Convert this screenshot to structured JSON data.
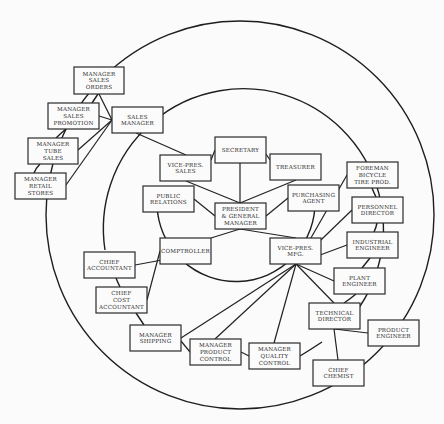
{
  "diagram": {
    "type": "organization-chart-circular",
    "rings": [
      {
        "name": "outer-ring",
        "cx": 240,
        "cy": 215,
        "r": 194
      },
      {
        "name": "middle-ring-arc",
        "path": "M 105 250 A 140 140 0 1 1 345 325"
      },
      {
        "name": "inner-ring-arc",
        "path": "M 157 205 A 70 70 0 1 0 315 200"
      }
    ],
    "nodes": [
      {
        "id": "mgr_sales_orders",
        "lines": [
          "MANAGER",
          "SALES",
          "ORDERS"
        ],
        "x": 74,
        "y": 67,
        "w": 50,
        "h": 27
      },
      {
        "id": "mgr_sales_promotion",
        "lines": [
          "MANAGER",
          "SALES",
          "PROMOTION"
        ],
        "x": 48,
        "y": 103,
        "w": 51,
        "h": 26
      },
      {
        "id": "sales_manager",
        "lines": [
          "SALES",
          "MANAGER"
        ],
        "x": 112,
        "y": 107,
        "w": 51,
        "h": 26
      },
      {
        "id": "mgr_tube_sales",
        "lines": [
          "MANAGER",
          "TUBE",
          "SALES"
        ],
        "x": 28,
        "y": 138,
        "w": 50,
        "h": 26
      },
      {
        "id": "mgr_retail_stores",
        "lines": [
          "MANAGER",
          "RETAIL",
          "STORES"
        ],
        "x": 15,
        "y": 173,
        "w": 51,
        "h": 26
      },
      {
        "id": "vp_sales",
        "lines": [
          "VICE-PRES.",
          "SALES"
        ],
        "x": 160,
        "y": 155,
        "w": 51,
        "h": 26
      },
      {
        "id": "secretary",
        "lines": [
          "SECRETARY"
        ],
        "x": 215,
        "y": 137,
        "w": 51,
        "h": 26
      },
      {
        "id": "treasurer",
        "lines": [
          "TREASURER"
        ],
        "x": 270,
        "y": 154,
        "w": 51,
        "h": 26
      },
      {
        "id": "public_relations",
        "lines": [
          "PUBLIC",
          "RELATIONS"
        ],
        "x": 143,
        "y": 186,
        "w": 51,
        "h": 26
      },
      {
        "id": "president",
        "lines": [
          "PRESIDENT",
          "& GENERAL",
          "MANAGER"
        ],
        "x": 215,
        "y": 203,
        "w": 51,
        "h": 26
      },
      {
        "id": "purchasing_agent",
        "lines": [
          "PURCHASING",
          "AGENT"
        ],
        "x": 288,
        "y": 185,
        "w": 51,
        "h": 26
      },
      {
        "id": "foreman_bicycle",
        "lines": [
          "FOREMAN",
          "BICYCLE",
          "TIRE PROD."
        ],
        "x": 347,
        "y": 162,
        "w": 51,
        "h": 26
      },
      {
        "id": "personnel_director",
        "lines": [
          "PERSONNEL",
          "DIRECTOR"
        ],
        "x": 352,
        "y": 197,
        "w": 51,
        "h": 26
      },
      {
        "id": "industrial_engineer",
        "lines": [
          "INDUSTRIAL",
          "ENGINEER"
        ],
        "x": 347,
        "y": 232,
        "w": 51,
        "h": 26
      },
      {
        "id": "comptroller",
        "lines": [
          "COMPTROLLER"
        ],
        "x": 160,
        "y": 238,
        "w": 51,
        "h": 26
      },
      {
        "id": "vp_mfg",
        "lines": [
          "VICE-PRES.",
          "MFG."
        ],
        "x": 270,
        "y": 238,
        "w": 51,
        "h": 26
      },
      {
        "id": "chief_accountant",
        "lines": [
          "CHIEF",
          "ACCOUNTANT"
        ],
        "x": 84,
        "y": 252,
        "w": 51,
        "h": 26
      },
      {
        "id": "plant_engineer",
        "lines": [
          "PLANT",
          "ENGINEER"
        ],
        "x": 334,
        "y": 268,
        "w": 51,
        "h": 26
      },
      {
        "id": "chief_cost_accountant",
        "lines": [
          "CHIEF",
          "COST",
          "ACCOUNTANT"
        ],
        "x": 96,
        "y": 287,
        "w": 51,
        "h": 26
      },
      {
        "id": "technical_director",
        "lines": [
          "TECHNICAL",
          "DIRECTOR"
        ],
        "x": 309,
        "y": 303,
        "w": 51,
        "h": 26
      },
      {
        "id": "product_engineer",
        "lines": [
          "PRODUCT",
          "ENGINEER"
        ],
        "x": 368,
        "y": 320,
        "w": 51,
        "h": 26
      },
      {
        "id": "mgr_shipping",
        "lines": [
          "MANAGER",
          "SHIPPING"
        ],
        "x": 130,
        "y": 325,
        "w": 51,
        "h": 26
      },
      {
        "id": "mgr_product_control",
        "lines": [
          "MANAGER",
          "PRODUCT",
          "CONTROL"
        ],
        "x": 190,
        "y": 339,
        "w": 51,
        "h": 26
      },
      {
        "id": "mgr_quality_control",
        "lines": [
          "MANAGER",
          "QUALITY",
          "CONTROL"
        ],
        "x": 249,
        "y": 343,
        "w": 51,
        "h": 26
      },
      {
        "id": "chief_chemist",
        "lines": [
          "CHIEF",
          "CHEMIST"
        ],
        "x": 313,
        "y": 360,
        "w": 51,
        "h": 26
      }
    ],
    "links": [
      [
        99,
        116,
        112,
        120
      ],
      [
        112,
        120,
        99,
        94
      ],
      [
        112,
        120,
        78,
        150
      ],
      [
        112,
        120,
        66,
        185
      ],
      [
        136,
        133,
        186,
        155
      ],
      [
        240,
        163,
        240,
        203
      ],
      [
        186,
        181,
        240,
        203
      ],
      [
        240,
        203,
        296,
        180
      ],
      [
        194,
        199,
        215,
        216
      ],
      [
        266,
        216,
        288,
        198
      ],
      [
        211,
        238,
        240,
        229
      ],
      [
        240,
        229,
        296,
        238
      ],
      [
        211,
        251,
        135,
        265
      ],
      [
        160,
        251,
        147,
        300
      ],
      [
        296,
        264,
        181,
        338
      ],
      [
        296,
        264,
        215,
        339
      ],
      [
        296,
        264,
        274,
        343
      ],
      [
        296,
        264,
        334,
        303
      ],
      [
        296,
        264,
        334,
        281
      ],
      [
        296,
        264,
        347,
        245
      ],
      [
        296,
        264,
        352,
        210
      ],
      [
        296,
        264,
        347,
        175
      ],
      [
        334,
        329,
        368,
        333
      ],
      [
        334,
        329,
        338,
        360
      ],
      [
        181,
        341,
        190,
        352
      ],
      [
        241,
        352,
        249,
        356
      ],
      [
        266,
        154,
        270,
        160
      ],
      [
        211,
        160,
        215,
        150
      ]
    ],
    "ring_segments": [
      "M 98 94 Q 94 100 92 103",
      "M 66 129 Q 60 134 56 138",
      "M 40 164 Q 36 168 34 173",
      "M 372 188 Q 374 193 376 197",
      "M 377 223 Q 376 228 374 232",
      "M 370 258 Q 366 263 362 268",
      "M 356 294 Q 350 299 344 303",
      "M 300 356 Q 310 350 322 342",
      "M 116 278 Q 118 283 120 287",
      "M 136 313 Q 140 319 144 325"
    ]
  }
}
